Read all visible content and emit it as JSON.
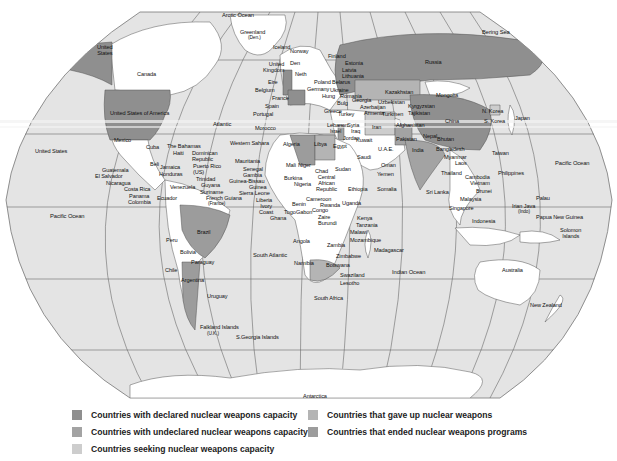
{
  "map": {
    "projection": "Robinson-style world map with graticule",
    "colors": {
      "ocean": "#e4e4e4",
      "land_default": "#ffffff",
      "declared": "#8f8f8f",
      "undeclared": "#a3a3a3",
      "seeking": "#cdcdcd",
      "gave_up": "#b4b4b4",
      "ended_programs": "#9c9c9c",
      "graticule": "#6a6a6a",
      "border": "#555555"
    },
    "labels": {
      "arctic_ocean": "Arctic Ocean",
      "greenland": "Greenland",
      "greenland_note": "(Den.)",
      "iceland": "Iceland",
      "norway": "Norway",
      "finland": "Finland",
      "estonia": "Estonia",
      "latvia": "Latvia",
      "lithuania": "Lithuania",
      "belarus": "Belarus",
      "poland": "Poland",
      "ukraine": "Ukraine",
      "germany": "Germany",
      "denmark": "Den",
      "neth": "Neth",
      "united_kingdom": "United\nKingdom",
      "eire": "Eire",
      "belgium": "Belgium",
      "france": "France",
      "spain": "Spain",
      "portugal": "Portugal",
      "morocco": "Morocco",
      "atlantic": "Atlantic",
      "russia": "Russia",
      "bering_sea": "Bering Sea",
      "mongolia": "Mongolia",
      "kazakhstan": "Kazakhstan",
      "uzbekistan": "Uzbekistan",
      "kyrgyzstan": "Kyrgyzstan",
      "tajikistan": "Tajikistan",
      "turkmenistan": "Turkmen",
      "georgia": "Georgia",
      "azerbaijan": "Azerbaijan",
      "armenia": "Armenia",
      "turkey": "Turkey",
      "greece": "Greece",
      "bulgaria": "Bulg",
      "romania": "Romania",
      "hungary": "Hung",
      "lebanon": "Lebanon",
      "syria": "Syria",
      "israel": "Israel",
      "jordan": "Jordan",
      "iraq": "Iraq",
      "iran": "Iran",
      "afghanistan": "Afghanistan",
      "pakistan": "Pakistan",
      "nepal": "Nepal",
      "bhutan": "Bhutan",
      "bangladesh": "Bangladesh",
      "india": "India",
      "china": "China",
      "n_korea": "N. Korea",
      "s_korea": "S. Korea",
      "japan": "Japan",
      "taiwan": "Taiwan",
      "myanmar": "Myanmar",
      "laos": "Laos",
      "thailand": "Thailand",
      "cambodia": "Cambodia",
      "vietnam": "Vietnam",
      "brunei": "Brunei",
      "malaysia": "Malaysia",
      "singapore": "Singapore",
      "indonesia": "Indonesia",
      "philippines": "Philippines",
      "sri_lanka": "Sri Lanka",
      "palau": "Palau",
      "irian_jaya": "Irian Java",
      "irian_jaya_note": "(Indo)",
      "papua_new_guinea": "Papua New Guinea",
      "solomon_islands": "Solomon\nIslands",
      "pacific_ocean_east": "Pacific Ocean",
      "australia": "Australia",
      "new_zealand": "New Zealand",
      "indian_ocean": "Indian Ocean",
      "canada": "Canada",
      "united_states_alaska": "United\nStates",
      "united_states_of_america": "United States of America",
      "united_states_hawaii": "United States",
      "mexico": "Mexico",
      "cuba": "Cuba",
      "the_bahamas": "The Bahamas",
      "haiti": "Haiti",
      "dominican_republic": "Dominican\nRepublic",
      "puerto_rico": "Puerto Rico\n(US)",
      "belize": "Beli",
      "jamaica": "Jamaica",
      "honduras": "Honduras",
      "guatemala": "Guatemala",
      "el_salvador": "El Salvador",
      "nicaragua": "Nicaragua",
      "costa_rica": "Costa Rica",
      "panama": "Panama",
      "colombia": "Colombia",
      "venezuela": "Venezuela",
      "trinidad": "Trinidad",
      "guyana": "Guyana",
      "suriname": "Suriname",
      "french_guiana": "French Guiana",
      "french_guiana_note": "(France)",
      "ecuador": "Ecuador",
      "peru": "Peru",
      "brazil": "Brazil",
      "bolivia": "Bolivia",
      "paraguay": "Paraguay",
      "chile": "Chile",
      "argentina": "Argentina",
      "uruguay": "Uruguay",
      "falkland_islands": "Falkland Islands",
      "falkland_note": "(U.K.)",
      "s_georgia_islands": "S.Georgia Islands",
      "pacific_ocean_west": "Pacific Ocean",
      "south_atlantic": "South Atlantic",
      "western_sahara": "Western Sahara",
      "mauritania": "Mauritania",
      "senegal": "Senegal",
      "gambia": "Gambia",
      "guinea_bissau": "Guinea-Bissau",
      "guinea": "Guinea",
      "sierra_leone": "Sierra Leone",
      "liberia": "Liberia",
      "ivory_coast": "Ivory\nCoast",
      "ghana": "Ghana",
      "togo": "Togo",
      "benin": "Benin",
      "burkina": "Burkina",
      "mali": "Mali",
      "niger": "Niger",
      "nigeria": "Nigeria",
      "algeria": "Algeria",
      "libya": "Libya",
      "egypt": "Egypt",
      "chad": "Chad",
      "sudan": "Sudan",
      "central_african_republic": "Central\nAfrican\nRepublic",
      "cameroon": "Cameroon",
      "gabon": "Gabon",
      "congo": "Congo",
      "zaire": "Zaire",
      "rwanda": "Rwanda",
      "burundi": "Burundi",
      "uganda": "Uganda",
      "ethiopia": "Ethiopia",
      "somalia": "Somalia",
      "kenya": "Kenya",
      "tanzania": "Tanzania",
      "malawi": "Malawi",
      "mozambique": "Mozambique",
      "madagascar": "Madagascar",
      "zambia": "Zambia",
      "zimbabwe": "Zimbabwe",
      "botswana": "Botswana",
      "namibia": "Namibia",
      "angola": "Angola",
      "south_africa": "South Africa",
      "swaziland": "Swaziland",
      "lesotho": "Lesotho",
      "saudi": "Saudi",
      "kuwait": "Kuwait",
      "uae": "U.A.E.",
      "oman": "Oman",
      "yemen": "Yemen",
      "antarctica": "Antarctica"
    }
  },
  "legend": {
    "items": [
      {
        "label": "Countries with declared nuclear weapons capacity",
        "color": "#8f8f8f"
      },
      {
        "label": "Countries with undeclared nuclear weapons capacity",
        "color": "#a3a3a3"
      },
      {
        "label": "Countries seeking nuclear weapons capacity",
        "color": "#cdcdcd"
      },
      {
        "label": "Countries that gave up nuclear weapons",
        "color": "#b4b4b4"
      },
      {
        "label": "Countries that ended nuclear weapons programs",
        "color": "#9c9c9c"
      }
    ]
  }
}
